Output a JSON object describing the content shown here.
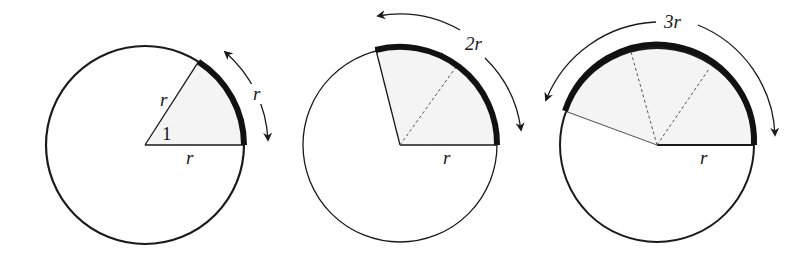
{
  "diagram": {
    "colors": {
      "stroke": "#1a1a1a",
      "sector_fill": "#f4f4f4",
      "background": "#ffffff"
    },
    "panels": [
      {
        "id": "one-radian",
        "radius_label": "r",
        "side_label": "r",
        "angle_label": "1",
        "arc_label": "r",
        "arc_multiple": 1
      },
      {
        "id": "two-radians",
        "radius_label": "r",
        "arc_label": "2r",
        "arc_multiple": 2
      },
      {
        "id": "three-radians",
        "radius_label": "r",
        "arc_label": "3r",
        "arc_multiple": 3
      }
    ]
  }
}
